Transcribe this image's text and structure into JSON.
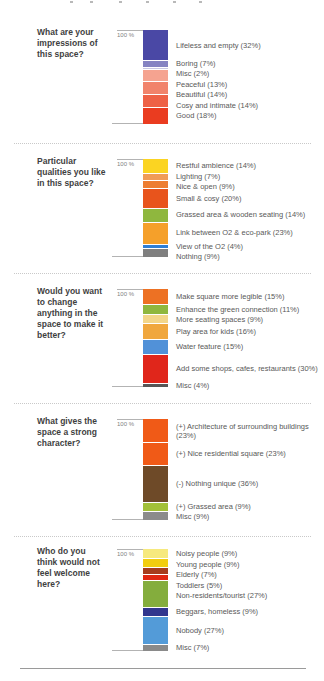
{
  "page": {
    "axis_label": "100 %"
  },
  "chart_data": [
    {
      "type": "bar",
      "stacked": true,
      "orientation": "vertical",
      "ylim": [
        0,
        100
      ],
      "unit": "percent",
      "title": "What are your impressions of this space?",
      "question_lines": [
        "What are your",
        "impressions of",
        "this space?"
      ],
      "segments": [
        {
          "label": "Lifeless and empty (32%)",
          "value": 32,
          "color": "#4a48a5"
        },
        {
          "label": "Boring (7%)",
          "value": 7,
          "color": "#8583c2"
        },
        {
          "label": "Misc (2%)",
          "value": 2,
          "color": "#c9c7e2"
        },
        {
          "label": "Peaceful (13%)",
          "value": 13,
          "color": "#f5a390"
        },
        {
          "label": "Beautiful (14%)",
          "value": 14,
          "color": "#f1836b"
        },
        {
          "label": "Cosy and intimate (14%)",
          "value": 14,
          "color": "#ee6146"
        },
        {
          "label": "Good (18%)",
          "value": 18,
          "color": "#ea3c20"
        }
      ]
    },
    {
      "type": "bar",
      "stacked": true,
      "orientation": "vertical",
      "ylim": [
        0,
        100
      ],
      "unit": "percent",
      "title": "Particular qualities you like in this space?",
      "question_lines": [
        "Particular",
        "qualities you like",
        "in this space?"
      ],
      "segments": [
        {
          "label": "Restful ambience (14%)",
          "value": 14,
          "color": "#fbd422"
        },
        {
          "label": "Lighting (7%)",
          "value": 7,
          "color": "#f09c57"
        },
        {
          "label": "Nice & open (9%)",
          "value": 9,
          "color": "#ed7d31"
        },
        {
          "label": "Small & cosy (20%)",
          "value": 20,
          "color": "#e8541c"
        },
        {
          "label": "Grassed area & wooden seating (14%)",
          "value": 14,
          "color": "#8fb73e"
        },
        {
          "label": "Link between O2 & eco-park (23%)",
          "value": 23,
          "color": "#f5a02a"
        },
        {
          "label": "View of the O2 (4%)",
          "value": 4,
          "color": "#2f7fd6"
        },
        {
          "label": "Nothing (9%)",
          "value": 9,
          "color": "#7f7f7f"
        }
      ]
    },
    {
      "type": "bar",
      "stacked": true,
      "orientation": "vertical",
      "ylim": [
        0,
        100
      ],
      "unit": "percent",
      "title": "Would you want to change anything in the space to make it better?",
      "question_lines": [
        "Would you want",
        "to change",
        "anything in the",
        "space to make it",
        "better?"
      ],
      "segments": [
        {
          "label": "Make square more legible (15%)",
          "value": 15,
          "color": "#ed7123"
        },
        {
          "label": "Enhance the green connection (11%)",
          "value": 11,
          "color": "#8fb73e"
        },
        {
          "label": "More seating spaces (9%)",
          "value": 9,
          "color": "#f3d689"
        },
        {
          "label": "Play area for kids (16%)",
          "value": 16,
          "color": "#f0a73e"
        },
        {
          "label": "Water feature (15%)",
          "value": 15,
          "color": "#5191d8"
        },
        {
          "label": "Add some shops, cafes, restaurants (30%)",
          "value": 30,
          "color": "#e0261b"
        },
        {
          "label": "Misc (4%)",
          "value": 4,
          "color": "#565656"
        }
      ]
    },
    {
      "type": "bar",
      "stacked": true,
      "orientation": "vertical",
      "ylim": [
        0,
        100
      ],
      "unit": "percent",
      "title": "What gives the space a strong character?",
      "question_lines": [
        "What gives the",
        "space a strong",
        "character?"
      ],
      "segments": [
        {
          "label": "(+) Architecture of surrounding buildings (23%)",
          "value": 23,
          "color": "#f05a17"
        },
        {
          "label": "(+) Nice residential square (23%)",
          "value": 23,
          "color": "#f05a17"
        },
        {
          "label": "(-) Nothing unique (36%)",
          "value": 36,
          "color": "#6e4a28"
        },
        {
          "label": "(+) Grassed area (9%)",
          "value": 9,
          "color": "#a2c037"
        },
        {
          "label": "Misc (9%)",
          "value": 9,
          "color": "#8b8b8b"
        }
      ]
    },
    {
      "type": "bar",
      "stacked": true,
      "orientation": "vertical",
      "ylim": [
        0,
        100
      ],
      "unit": "percent",
      "title": "Who do you think would not feel welcome here?",
      "question_lines": [
        "Who do you",
        "think would not",
        "feel welcome",
        "here?"
      ],
      "segments": [
        {
          "label": "Noisy people (9%)",
          "value": 9,
          "color": "#f6e97e"
        },
        {
          "label": "Young people (9%)",
          "value": 9,
          "color": "#f2cd0f"
        },
        {
          "label": "Elderly (7%)",
          "value": 7,
          "color": "#a63c1d"
        },
        {
          "label": "Toddlers (5%)",
          "value": 5,
          "color": "#e02712"
        },
        {
          "label": "Non-residents/tourist (27%)",
          "value": 27,
          "color": "#84ad3d"
        },
        {
          "label": "Beggars, homeless (9%)",
          "value": 9,
          "color": "#31368e"
        },
        {
          "label": "Nobody (27%)",
          "value": 27,
          "color": "#539bd8"
        },
        {
          "label": "Misc (7%)",
          "value": 7,
          "color": "#8a8a8a"
        }
      ]
    }
  ]
}
